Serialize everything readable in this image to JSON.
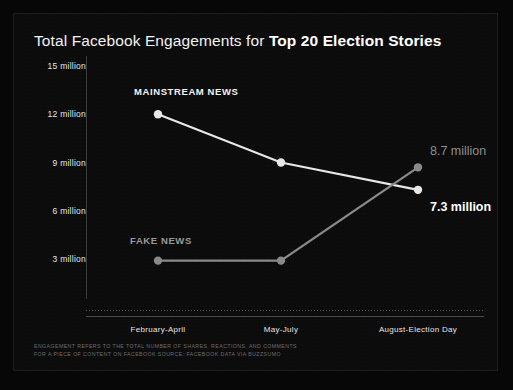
{
  "chart_data": {
    "type": "line",
    "title_plain": "Total Facebook Engagements for ",
    "title_bold": "Top 20 Election Stories",
    "categories": [
      "February-April",
      "May-July",
      "August-Election Day"
    ],
    "series": [
      {
        "name": "MAINSTREAM NEWS",
        "values": [
          12.0,
          9.0,
          7.3
        ],
        "color": "#e8e8e8",
        "end_label": "7.3 million"
      },
      {
        "name": "FAKE NEWS",
        "values": [
          2.9,
          2.9,
          8.7
        ],
        "color": "#8a8a8a",
        "end_label": "8.7 million"
      }
    ],
    "ylabel": "",
    "xlabel": "",
    "ylim": [
      0,
      15
    ],
    "yticks": [
      15,
      12,
      9,
      6,
      3
    ],
    "ytick_labels": [
      "15 million",
      "12 million",
      "9 million",
      "6 million",
      "3 million"
    ],
    "grid": false,
    "legend": "inline-series-labels",
    "units": "million engagements",
    "background_color": "#0b0b0b",
    "text_color": "#f2f2f2"
  },
  "footnote": {
    "line1": "ENGAGEMENT REFERS TO THE TOTAL NUMBER OF SHARES, REACTIONS, AND COMMENTS",
    "line2": "FOR A PIECE OF CONTENT ON FACEBOOK SOURCE: FACEBOOK DATA VIA BUZZSUMO"
  }
}
